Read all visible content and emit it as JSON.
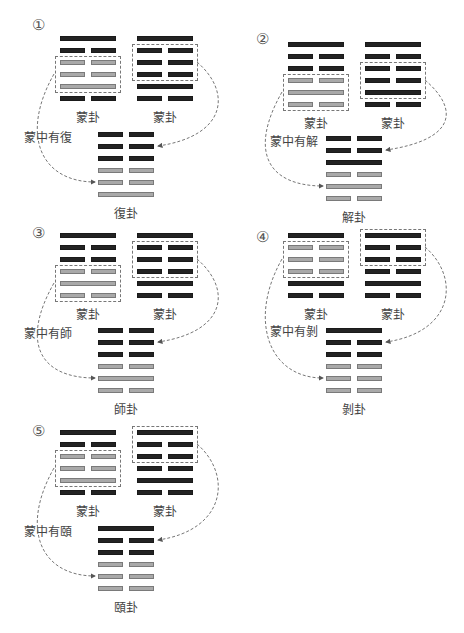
{
  "colors": {
    "changed_line": "#a9a9a9",
    "unchanged_line": "#232323",
    "dashed_box": "#777777"
  },
  "panels": [
    {
      "number": "①",
      "caption": "蒙中有復",
      "source_left": {
        "label": "蒙卦",
        "lines": [
          "solid",
          "broken",
          "broken",
          "broken",
          "solid",
          "broken"
        ],
        "highlight": [
          3,
          5
        ],
        "highlight_color": "gray"
      },
      "source_right": {
        "label": "蒙卦",
        "lines": [
          "solid",
          "broken",
          "broken",
          "broken",
          "solid",
          "broken"
        ],
        "highlight": [
          2,
          4
        ]
      },
      "result": {
        "label": "復卦",
        "lines": [
          "broken",
          "broken",
          "broken",
          "broken",
          "broken",
          "solid"
        ],
        "upper_from": "right box",
        "lower_from": "left box"
      }
    },
    {
      "number": "②",
      "caption": "蒙中有解",
      "source_left": {
        "label": "蒙卦",
        "lines": [
          "solid",
          "broken",
          "broken",
          "broken",
          "solid",
          "broken"
        ],
        "highlight": [
          4,
          6
        ],
        "highlight_color": "gray"
      },
      "source_right": {
        "label": "蒙卦",
        "lines": [
          "solid",
          "broken",
          "broken",
          "broken",
          "solid",
          "broken"
        ],
        "highlight": [
          3,
          5
        ]
      },
      "result": {
        "label": "解卦",
        "lines": [
          "broken",
          "broken",
          "solid",
          "broken",
          "solid",
          "broken"
        ]
      }
    },
    {
      "number": "③",
      "caption": "蒙中有師",
      "source_left": {
        "label": "蒙卦",
        "lines": [
          "solid",
          "broken",
          "broken",
          "broken",
          "solid",
          "broken"
        ],
        "highlight": [
          4,
          6
        ],
        "highlight_color": "gray"
      },
      "source_right": {
        "label": "蒙卦",
        "lines": [
          "solid",
          "broken",
          "broken",
          "broken",
          "solid",
          "broken"
        ],
        "highlight": [
          2,
          4
        ]
      },
      "result": {
        "label": "師卦",
        "lines": [
          "broken",
          "broken",
          "broken",
          "broken",
          "solid",
          "broken"
        ]
      }
    },
    {
      "number": "④",
      "caption": "蒙中有剝",
      "source_left": {
        "label": "蒙卦",
        "lines": [
          "solid",
          "broken",
          "broken",
          "broken",
          "solid",
          "broken"
        ],
        "highlight": [
          2,
          4
        ],
        "highlight_color": "gray"
      },
      "source_right": {
        "label": "蒙卦",
        "lines": [
          "solid",
          "broken",
          "broken",
          "broken",
          "solid",
          "broken"
        ],
        "highlight": [
          1,
          3
        ]
      },
      "result": {
        "label": "剝卦",
        "lines": [
          "solid",
          "broken",
          "broken",
          "broken",
          "broken",
          "broken"
        ]
      }
    },
    {
      "number": "⑤",
      "caption": "蒙中有頤",
      "source_left": {
        "label": "蒙卦",
        "lines": [
          "solid",
          "broken",
          "broken",
          "broken",
          "solid",
          "broken"
        ],
        "highlight": [
          3,
          5
        ],
        "highlight_color": "gray"
      },
      "source_right": {
        "label": "蒙卦",
        "lines": [
          "solid",
          "broken",
          "broken",
          "broken",
          "solid",
          "broken"
        ],
        "highlight": [
          1,
          3
        ]
      },
      "result": {
        "label": "頤卦",
        "lines": [
          "solid",
          "broken",
          "broken",
          "broken",
          "broken",
          "broken"
        ]
      }
    }
  ]
}
